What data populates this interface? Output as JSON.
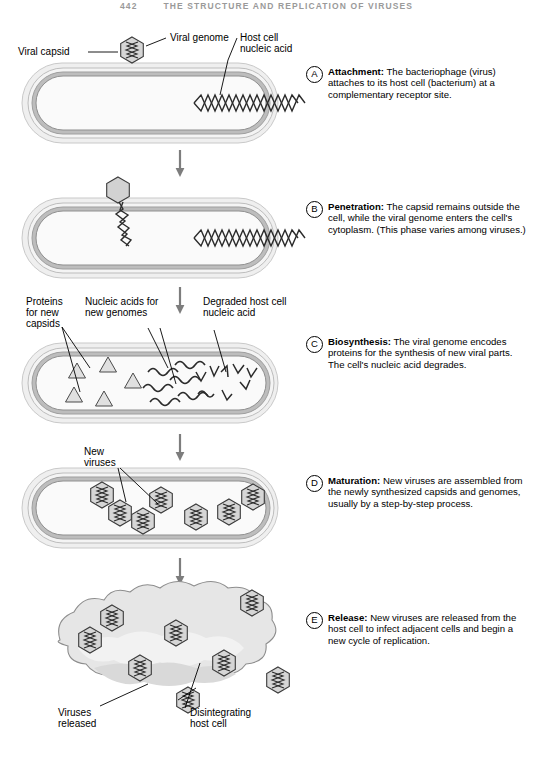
{
  "running_head": {
    "page_number": "442",
    "title": "THE STRUCTURE AND REPLICATION OF VIRUSES"
  },
  "figure": {
    "stages": [
      {
        "letter": "A",
        "term": "Attachment:",
        "text": " The bacteriophage (virus) attaches to its host cell (bacterium) at a complementary receptor site."
      },
      {
        "letter": "B",
        "term": "Penetration:",
        "text": " The capsid remains outside the cell, while the viral genome enters the cell's cytoplasm. (This phase varies among viruses.)"
      },
      {
        "letter": "C",
        "term": "Biosynthesis:",
        "text": " The viral genome encodes proteins for the synthesis of new viral parts. The cell's nucleic acid degrades."
      },
      {
        "letter": "D",
        "term": "Maturation:",
        "text": " New viruses are assembled from the newly synthesized capsids and genomes, usually by a step-by-step process."
      },
      {
        "letter": "E",
        "term": "Release:",
        "text": " New viruses are released from the host cell to infect adjacent cells and begin a new cycle of replication."
      }
    ],
    "labels": {
      "viral_capsid": "Viral capsid",
      "viral_genome": "Viral genome",
      "host_cell_nucleic_acid_line1": "Host cell",
      "host_cell_nucleic_acid_line2": "nucleic acid",
      "proteins_line1": "Proteins",
      "proteins_line2": "for new",
      "proteins_line3": "capsids",
      "nucleic_acids_line1": "Nucleic acids for",
      "nucleic_acids_line2": "new genomes",
      "degraded_line1": "Degraded host cell",
      "degraded_line2": "nucleic acid",
      "new_viruses_line1": "New",
      "new_viruses_line2": "viruses",
      "viruses_released_line1": "Viruses",
      "viruses_released_line2": "released",
      "disintegrating_line1": "Disintegrating",
      "disintegrating_line2": "host cell"
    },
    "colors": {
      "cell_halo": "#efefef",
      "cell_wall": "#b8b8b8",
      "cytoplasm": "#f7f7f7",
      "capsid_fill": "#d6d6d6",
      "outline": "#3a3a3a",
      "lysed_fill": "#e2e2e2"
    }
  }
}
